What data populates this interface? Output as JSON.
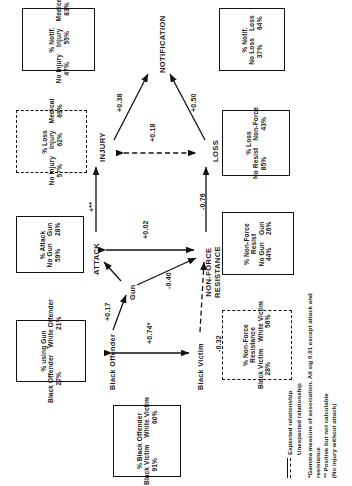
{
  "diagram": {
    "nodes": [
      {
        "id": "notification",
        "label": "NOTIFICATION"
      },
      {
        "id": "injury",
        "label": "INJURY"
      },
      {
        "id": "loss",
        "label": "LOSS"
      },
      {
        "id": "attack",
        "label": "ATTACK"
      },
      {
        "id": "nonforce",
        "label": "NON-FORCE",
        "label2": "RESISTANCE"
      },
      {
        "id": "gun",
        "label": "Gun"
      },
      {
        "id": "black_offender",
        "label": "Black Offender"
      },
      {
        "id": "black_victim",
        "label": "Black Victim"
      }
    ],
    "edges": [
      {
        "id": "injury-notification",
        "coef": "+0.38",
        "style": "solid"
      },
      {
        "id": "loss-notification",
        "coef": "+0.50",
        "style": "solid"
      },
      {
        "id": "injury-loss",
        "coef": "+0.18",
        "style": "dashed"
      },
      {
        "id": "attack-injury",
        "coef": "+**",
        "style": "solid"
      },
      {
        "id": "nonforce-loss",
        "coef": "-0.76",
        "style": "solid"
      },
      {
        "id": "attack-nonforce",
        "coef": "+0.02",
        "style": "solid"
      },
      {
        "id": "black_offender-gun",
        "coef": "+0.17",
        "style": "solid"
      },
      {
        "id": "gun-nonforce",
        "coef": "-0.40",
        "style": "solid"
      },
      {
        "id": "black_offender-black_victim",
        "coef": "+0.74*",
        "style": "solid"
      },
      {
        "id": "black_victim-nonforce",
        "coef": "-0.32",
        "style": "dashed"
      }
    ]
  },
  "boxes": {
    "notif_injury": {
      "header": "% Notif.",
      "style": "solid",
      "pairs": [
        {
          "label": "No Injury",
          "value": "47%"
        },
        {
          "label": "Injury",
          "value": "55%"
        },
        {
          "label": "Medical",
          "value": "83%"
        }
      ]
    },
    "notif_loss": {
      "header": "% Notif.",
      "style": "solid",
      "pairs": [
        {
          "label": "No Loss",
          "value": "37%"
        },
        {
          "label": "Loss",
          "value": "64%"
        }
      ]
    },
    "loss_injury": {
      "header": "% Loss",
      "style": "dashed",
      "pairs": [
        {
          "label": "No Injury",
          "value": "57%"
        },
        {
          "label": "Injury",
          "value": "62%"
        },
        {
          "label": "Medical",
          "value": "69%"
        }
      ]
    },
    "loss_resist": {
      "header": "% Loss",
      "style": "solid",
      "pairs": [
        {
          "label": "No Resist",
          "value": "85%"
        },
        {
          "label": "Non-Force",
          "value": "43%"
        }
      ]
    },
    "attack_gun": {
      "header": "% Attack",
      "style": "solid",
      "pairs": [
        {
          "label": "No Gun",
          "value": "59%"
        },
        {
          "label": "Gun",
          "value": "28%"
        }
      ]
    },
    "nonforce_gun": {
      "header": "% Non-Force",
      "header2": "Resist",
      "style": "solid",
      "pairs": [
        {
          "label": "No Gun",
          "value": "44%"
        },
        {
          "label": "Gun",
          "value": "26%"
        }
      ]
    },
    "gun_race": {
      "header": "% using Gun",
      "style": "solid",
      "pairs": [
        {
          "label": "Black Offender",
          "value": "27%"
        },
        {
          "label": "White Offender",
          "value": "21%"
        }
      ]
    },
    "nonforce_race": {
      "header": "% Non-Force",
      "header2": "Resistance",
      "style": "dashed",
      "pairs": [
        {
          "label": "Black Victim",
          "value": "28%"
        },
        {
          "label": "White Victim",
          "value": "56%"
        }
      ]
    },
    "offender_victim": {
      "header": "% Black Offender",
      "style": "solid",
      "pairs": [
        {
          "label": "Black Victim",
          "value": "91%"
        },
        {
          "label": "White Victim",
          "value": "60%"
        }
      ]
    }
  },
  "legend": {
    "solid_label": "Expected relationship",
    "dashed_label": "Unexpected relationship",
    "note1": "*Gamma measure of association. All sig 0.01 except attack and resistance",
    "note2": "** Positive but not calculable",
    "note3": "(No injury without attack)"
  }
}
